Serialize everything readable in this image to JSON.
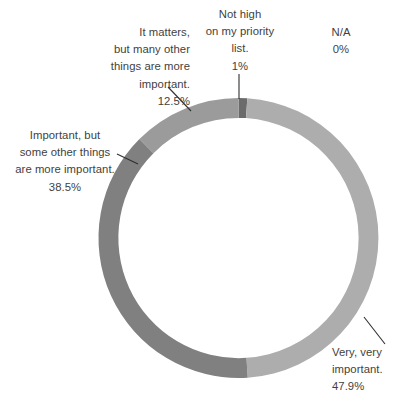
{
  "chart_data": {
    "type": "pie",
    "variant": "donut",
    "title": "",
    "subtitle": "",
    "xlabel": "",
    "ylabel": "",
    "grid": false,
    "legend_position": "none",
    "labels_position": "outside-with-leader-lines",
    "start_angle_deg": 0,
    "direction": "clockwise",
    "inner_radius_ratio": 0.858,
    "total_percent": "99.9%",
    "categories": [
      "Not high on my priority list.",
      "Very, very important.",
      "Important, but some other things are more important.",
      "It matters, but many other things are more important.",
      "N/A"
    ],
    "values": [
      1,
      47.9,
      38.5,
      12.5,
      0
    ],
    "value_labels": [
      "1%",
      "47.9%",
      "38.5%",
      "12.5%",
      "0%"
    ],
    "colors": [
      "#6b6b6b",
      "#adadad",
      "#808080",
      "#9b9b9b",
      "#cccccc"
    ],
    "slices": [
      {
        "name": "not-high-priority",
        "value": 1,
        "value_label": "1%",
        "color": "#6b6b6b",
        "start_deg": 0,
        "end_deg": 3.6,
        "has_visible_slice": true
      },
      {
        "name": "very-very-important",
        "value": 47.9,
        "value_label": "47.9%",
        "color": "#adadad",
        "start_deg": 3.6,
        "end_deg": 176.04,
        "has_visible_slice": true
      },
      {
        "name": "important-but-some-other",
        "value": 38.5,
        "value_label": "38.5%",
        "color": "#808080",
        "start_deg": 176.04,
        "end_deg": 314.64,
        "has_visible_slice": true
      },
      {
        "name": "it-matters-but-many-other",
        "value": 12.5,
        "value_label": "12.5%",
        "color": "#9b9b9b",
        "start_deg": 314.64,
        "end_deg": 359.64,
        "has_visible_slice": true
      },
      {
        "name": "not-applicable",
        "value": 0,
        "value_label": "0%",
        "color": "#cccccc",
        "start_deg": 359.64,
        "end_deg": 359.64,
        "has_visible_slice": false
      }
    ]
  },
  "labels": {
    "it_matters": {
      "line1": "It matters,",
      "line2": "but many other",
      "line3": "things are more",
      "line4": "important.",
      "percent": "12.5%"
    },
    "important_but": {
      "line1": "Important, but",
      "line2": "some other things",
      "line3": "are more important.",
      "percent": "38.5%"
    },
    "not_high": {
      "line1": "Not high",
      "line2": "on my priority",
      "line3": "list.",
      "percent": "1%"
    },
    "na": {
      "line1": "N/A",
      "percent": "0%"
    },
    "very_important": {
      "line1": "Very, very",
      "line2": "important.",
      "percent": "47.9%"
    }
  },
  "style": {
    "background": "#ffffff",
    "text_color": "#3f3f3f",
    "leader_line_color": "#2f2f2f"
  }
}
